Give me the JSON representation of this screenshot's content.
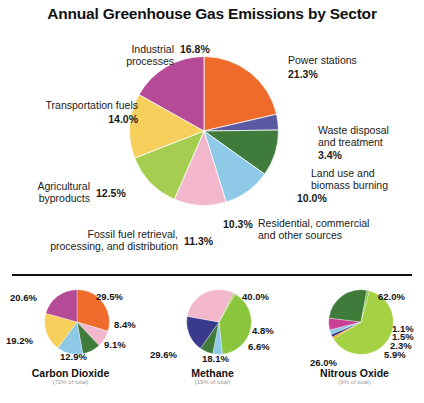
{
  "title": "Annual Greenhouse Gas Emissions by Sector",
  "chart_data": [
    {
      "type": "pie",
      "id": "main",
      "title": "Annual Greenhouse Gas Emissions by Sector",
      "unit": "%",
      "legend_position": "around-slices",
      "categories": [
        "Power stations",
        "Waste disposal and treatment",
        "Land use and biomass burning",
        "Residential, commercial and other sources",
        "Fossil fuel retrieval, processing, and distribution",
        "Agricultural byproducts",
        "Transportation fuels",
        "Industrial processes"
      ],
      "values": [
        21.3,
        3.4,
        10.0,
        10.3,
        11.3,
        12.5,
        14.0,
        16.8
      ],
      "labels": [
        "21.3%",
        "3.4%",
        "10.0%",
        "10.3%",
        "11.3%",
        "12.5%",
        "14.0%",
        "16.8%"
      ],
      "colors": [
        "#ee6b2c",
        "#5a5aa2",
        "#3f7b3a",
        "#8fc9e8",
        "#f2b7cc",
        "#a5cd50",
        "#f6cf5c",
        "#b54a96"
      ]
    },
    {
      "type": "pie",
      "id": "carbon-dioxide",
      "title": "Carbon Dioxide",
      "subtitle": "(72% of total)",
      "unit": "%",
      "values": [
        29.5,
        8.4,
        9.1,
        12.9,
        19.2,
        20.6
      ],
      "labels": [
        "29.5%",
        "8.4%",
        "9.1%",
        "12.9%",
        "19.2%",
        "20.6%"
      ],
      "colors": [
        "#ee6b2c",
        "#f2b7cc",
        "#3f7b3a",
        "#8fc9e8",
        "#f6cf5c",
        "#b54a96"
      ]
    },
    {
      "type": "pie",
      "id": "methane",
      "title": "Methane",
      "subtitle": "(19% of total)",
      "unit": "%",
      "values": [
        40.0,
        4.8,
        6.6,
        18.1,
        29.6,
        0.9
      ],
      "labels": [
        "40.0%",
        "4.8%",
        "6.6%",
        "18.1%",
        "29.6%",
        ""
      ],
      "colors": [
        "#8ac53e",
        "#8fc9e8",
        "#3f7b3a",
        "#3a3a8c",
        "#f2b7cc",
        "#a5cd50"
      ]
    },
    {
      "type": "pie",
      "id": "nitrous-oxide",
      "title": "Nitrous Oxide",
      "subtitle": "(9% of total)",
      "unit": "%",
      "values": [
        62.0,
        1.1,
        1.5,
        2.3,
        5.9,
        26.0,
        1.2
      ],
      "labels": [
        "62.0%",
        "1.1%",
        "1.5%",
        "2.3%",
        "5.9%",
        "26.0%",
        ""
      ],
      "colors": [
        "#a5d145",
        "#f0a800",
        "#3a3a8c",
        "#8fc9e8",
        "#cc3f96",
        "#3f7b3a",
        "#8ac53e"
      ]
    }
  ],
  "main_labels": {
    "industrial_name_l1": "Industrial",
    "industrial_name_l2": "processes",
    "industrial_pct": "16.8%",
    "power_name": "Power stations",
    "power_pct": "21.3%",
    "waste_name_l1": "Waste disposal",
    "waste_name_l2": "and treatment",
    "waste_pct": "3.4%",
    "land_name_l1": "Land use and",
    "land_name_l2": "biomass burning",
    "land_pct": "10.0%",
    "resid_name_l1": "Residential, commercial",
    "resid_name_l2": "and other sources",
    "resid_pct": "10.3%",
    "transport_name": "Transportation fuels",
    "transport_pct": "14.0%",
    "agri_name_l1": "Agricultural",
    "agri_name_l2": "byproducts",
    "agri_pct": "12.5%",
    "fossil_name_l1": "Fossil fuel retrieval,",
    "fossil_name_l2": "processing, and distribution",
    "fossil_pct": "11.3%"
  },
  "sub_charts": [
    {
      "name": "Carbon Dioxide",
      "note": "(72% of total)",
      "labels": [
        "29.5%",
        "8.4%",
        "9.1%",
        "12.9%",
        "19.2%",
        "20.6%"
      ]
    },
    {
      "name": "Methane",
      "note": "(19% of total)",
      "labels": [
        "40.0%",
        "4.8%",
        "6.6%",
        "18.1%",
        "29.6%"
      ]
    },
    {
      "name": "Nitrous Oxide",
      "note": "(9% of total)",
      "labels": [
        "62.0%",
        "1.1%",
        "1.5%",
        "2.3%",
        "5.9%",
        "26.0%"
      ]
    }
  ]
}
